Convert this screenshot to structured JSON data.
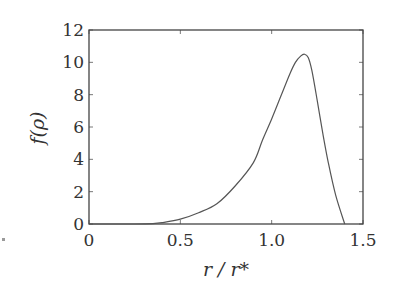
{
  "chart_data": {
    "type": "line",
    "title": "",
    "xlabel": "r / r*",
    "ylabel": "f(ρ)",
    "xlim": [
      0,
      1.5
    ],
    "ylim": [
      0,
      12
    ],
    "xticks": [
      0,
      0.5,
      1.0,
      1.5
    ],
    "xtick_labels": [
      "0",
      "0.5",
      "1.0",
      "1.5"
    ],
    "yticks": [
      0,
      2,
      4,
      6,
      8,
      10,
      12
    ],
    "ytick_labels": [
      "0",
      "2",
      "4",
      "6",
      "8",
      "10",
      "12"
    ],
    "grid": false,
    "legend": null,
    "series": [
      {
        "name": "f(ρ)",
        "color": "#555555",
        "x": [
          0.0,
          0.25,
          0.35,
          0.4,
          0.5,
          0.6,
          0.7,
          0.8,
          0.9,
          0.95,
          1.0,
          1.05,
          1.1,
          1.13,
          1.16,
          1.18,
          1.2,
          1.22,
          1.25,
          1.28,
          1.31,
          1.35,
          1.4
        ],
        "y": [
          0.0,
          0.0,
          0.02,
          0.08,
          0.3,
          0.7,
          1.25,
          2.35,
          3.8,
          5.2,
          6.5,
          7.9,
          9.3,
          10.0,
          10.4,
          10.5,
          10.3,
          9.5,
          7.6,
          5.6,
          3.8,
          1.8,
          0.0
        ]
      }
    ]
  },
  "labels": {
    "x_axis": "r / r*",
    "y_axis": "f(ρ)"
  }
}
